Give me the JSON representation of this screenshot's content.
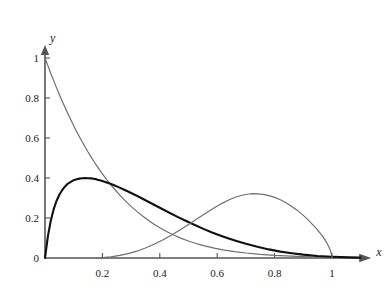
{
  "chart_data": {
    "type": "line",
    "title": "",
    "subtitle": "",
    "xlabel": "x",
    "ylabel": "y",
    "xlim": [
      0,
      1.14
    ],
    "ylim": [
      0,
      1.06
    ],
    "grid": false,
    "legend": null,
    "x_ticks": [
      {
        "value": 0.2,
        "label": "0.2"
      },
      {
        "value": 0.4,
        "label": "0.4"
      },
      {
        "value": 0.6,
        "label": "0.6"
      },
      {
        "value": 0.8,
        "label": "0.8"
      },
      {
        "value": 1.0,
        "label": "1"
      }
    ],
    "y_ticks": [
      {
        "value": 0.2,
        "label": "0.2"
      },
      {
        "value": 0.4,
        "label": "0.4"
      },
      {
        "value": 0.6,
        "label": "0.6"
      },
      {
        "value": 0.8,
        "label": "0.8"
      },
      {
        "value": 1.0,
        "label": "1"
      }
    ],
    "origin_label": "0",
    "series": [
      {
        "name": "decaying-curve",
        "color": "#6e6e6e",
        "width": 1.2,
        "points": [
          [
            0.0,
            1.0
          ],
          [
            0.01,
            0.962
          ],
          [
            0.02,
            0.924
          ],
          [
            0.03,
            0.888
          ],
          [
            0.04,
            0.852
          ],
          [
            0.05,
            0.818
          ],
          [
            0.06,
            0.784
          ],
          [
            0.07,
            0.752
          ],
          [
            0.08,
            0.721
          ],
          [
            0.09,
            0.691
          ],
          [
            0.1,
            0.661
          ],
          [
            0.11,
            0.633
          ],
          [
            0.12,
            0.606
          ],
          [
            0.13,
            0.58
          ],
          [
            0.14,
            0.555
          ],
          [
            0.15,
            0.53
          ],
          [
            0.16,
            0.507
          ],
          [
            0.17,
            0.484
          ],
          [
            0.18,
            0.462
          ],
          [
            0.19,
            0.441
          ],
          [
            0.2,
            0.421
          ],
          [
            0.215,
            0.392
          ],
          [
            0.23,
            0.365
          ],
          [
            0.245,
            0.34
          ],
          [
            0.26,
            0.316
          ],
          [
            0.275,
            0.293
          ],
          [
            0.29,
            0.272
          ],
          [
            0.305,
            0.252
          ],
          [
            0.32,
            0.233
          ],
          [
            0.34,
            0.21
          ],
          [
            0.36,
            0.189
          ],
          [
            0.38,
            0.169
          ],
          [
            0.4,
            0.151
          ],
          [
            0.425,
            0.131
          ],
          [
            0.45,
            0.114
          ],
          [
            0.475,
            0.098
          ],
          [
            0.5,
            0.085
          ],
          [
            0.53,
            0.071
          ],
          [
            0.56,
            0.059
          ],
          [
            0.59,
            0.049
          ],
          [
            0.62,
            0.041
          ],
          [
            0.66,
            0.032
          ],
          [
            0.7,
            0.025
          ],
          [
            0.75,
            0.018
          ],
          [
            0.8,
            0.013
          ],
          [
            0.86,
            0.009
          ],
          [
            0.92,
            0.006
          ],
          [
            1.0,
            0.003
          ],
          [
            1.06,
            0.002
          ],
          [
            1.1,
            0.001
          ]
        ]
      },
      {
        "name": "black-peak-curve",
        "color": "#111111",
        "width": 2.1,
        "points": [
          [
            0.0,
            0.0
          ],
          [
            0.01,
            0.108
          ],
          [
            0.02,
            0.186
          ],
          [
            0.03,
            0.243
          ],
          [
            0.04,
            0.285
          ],
          [
            0.05,
            0.316
          ],
          [
            0.06,
            0.34
          ],
          [
            0.07,
            0.358
          ],
          [
            0.08,
            0.372
          ],
          [
            0.09,
            0.381
          ],
          [
            0.1,
            0.389
          ],
          [
            0.11,
            0.394
          ],
          [
            0.12,
            0.397
          ],
          [
            0.13,
            0.399
          ],
          [
            0.14,
            0.4
          ],
          [
            0.15,
            0.399
          ],
          [
            0.16,
            0.398
          ],
          [
            0.17,
            0.396
          ],
          [
            0.18,
            0.393
          ],
          [
            0.19,
            0.389
          ],
          [
            0.2,
            0.385
          ],
          [
            0.215,
            0.378
          ],
          [
            0.23,
            0.37
          ],
          [
            0.245,
            0.361
          ],
          [
            0.26,
            0.352
          ],
          [
            0.28,
            0.339
          ],
          [
            0.3,
            0.325
          ],
          [
            0.32,
            0.311
          ],
          [
            0.34,
            0.296
          ],
          [
            0.36,
            0.281
          ],
          [
            0.38,
            0.266
          ],
          [
            0.4,
            0.251
          ],
          [
            0.43,
            0.229
          ],
          [
            0.46,
            0.207
          ],
          [
            0.49,
            0.186
          ],
          [
            0.52,
            0.166
          ],
          [
            0.55,
            0.147
          ],
          [
            0.58,
            0.129
          ],
          [
            0.61,
            0.113
          ],
          [
            0.64,
            0.098
          ],
          [
            0.67,
            0.084
          ],
          [
            0.7,
            0.071
          ],
          [
            0.74,
            0.056
          ],
          [
            0.78,
            0.043
          ],
          [
            0.82,
            0.032
          ],
          [
            0.86,
            0.024
          ],
          [
            0.9,
            0.017
          ],
          [
            0.95,
            0.01
          ],
          [
            1.0,
            0.006
          ],
          [
            1.06,
            0.003
          ],
          [
            1.1,
            0.002
          ]
        ]
      },
      {
        "name": "rising-peak-curve",
        "color": "#6e6e6e",
        "width": 1.2,
        "points": [
          [
            0.18,
            0.0
          ],
          [
            0.2,
            0.002
          ],
          [
            0.23,
            0.006
          ],
          [
            0.26,
            0.013
          ],
          [
            0.29,
            0.022
          ],
          [
            0.32,
            0.034
          ],
          [
            0.35,
            0.05
          ],
          [
            0.38,
            0.069
          ],
          [
            0.41,
            0.09
          ],
          [
            0.44,
            0.114
          ],
          [
            0.47,
            0.14
          ],
          [
            0.5,
            0.168
          ],
          [
            0.53,
            0.196
          ],
          [
            0.56,
            0.224
          ],
          [
            0.59,
            0.251
          ],
          [
            0.615,
            0.272
          ],
          [
            0.64,
            0.29
          ],
          [
            0.665,
            0.305
          ],
          [
            0.69,
            0.315
          ],
          [
            0.71,
            0.32
          ],
          [
            0.725,
            0.322
          ],
          [
            0.74,
            0.321
          ],
          [
            0.76,
            0.318
          ],
          [
            0.78,
            0.312
          ],
          [
            0.8,
            0.303
          ],
          [
            0.82,
            0.291
          ],
          [
            0.84,
            0.276
          ],
          [
            0.86,
            0.258
          ],
          [
            0.88,
            0.237
          ],
          [
            0.9,
            0.213
          ],
          [
            0.915,
            0.193
          ],
          [
            0.93,
            0.171
          ],
          [
            0.945,
            0.148
          ],
          [
            0.955,
            0.131
          ],
          [
            0.965,
            0.113
          ],
          [
            0.975,
            0.092
          ],
          [
            0.982,
            0.075
          ],
          [
            0.988,
            0.059
          ],
          [
            0.993,
            0.043
          ],
          [
            0.997,
            0.026
          ],
          [
            0.999,
            0.013
          ],
          [
            1.0,
            0.0
          ]
        ]
      }
    ]
  },
  "axes": {
    "x_axis_name": "x",
    "y_axis_name": "y",
    "axis_color": "#555555"
  }
}
